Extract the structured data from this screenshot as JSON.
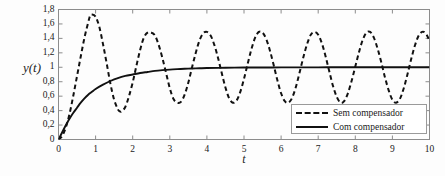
{
  "chart_data": {
    "type": "line",
    "title": "",
    "xlabel": "t",
    "ylabel": "y(t)",
    "xlim": [
      0,
      10
    ],
    "ylim": [
      0,
      1.8
    ],
    "grid": false,
    "legend_position": "lower-right",
    "x_ticks": [
      "0",
      "1",
      "2",
      "3",
      "4",
      "5",
      "6",
      "7",
      "8",
      "9",
      "10"
    ],
    "x_tick_values": [
      0,
      1,
      2,
      3,
      4,
      5,
      6,
      7,
      8,
      9,
      10
    ],
    "y_ticks": [
      "0",
      "0,2",
      "0,4",
      "0,6",
      "0,8",
      "1",
      "1,2",
      "1,4",
      "1,6",
      "1,8"
    ],
    "y_tick_values": [
      0,
      0.2,
      0.4,
      0.6,
      0.8,
      1.0,
      1.2,
      1.4,
      1.6,
      1.8
    ],
    "series": [
      {
        "name": "Sem compensador",
        "style": "dashed",
        "color": "#111111",
        "x": [
          0,
          0.1,
          0.2,
          0.3,
          0.4,
          0.5,
          0.6,
          0.7,
          0.8,
          0.85,
          0.9,
          1.0,
          1.1,
          1.2,
          1.3,
          1.4,
          1.5,
          1.6,
          1.65,
          1.7,
          1.8,
          1.9,
          2.0,
          2.1,
          2.2,
          2.3,
          2.4,
          2.5,
          2.6,
          2.7,
          2.8,
          2.9,
          3.0,
          3.1,
          3.2,
          3.3,
          3.4,
          3.5,
          3.6,
          3.7,
          3.8,
          3.9,
          4.0,
          4.1,
          4.2,
          4.3,
          4.4,
          4.5,
          4.6,
          4.7,
          4.8,
          4.9,
          5.0,
          5.1,
          5.2,
          5.3,
          5.4,
          5.5,
          5.6,
          5.7,
          5.8,
          5.9,
          6.0,
          6.1,
          6.2,
          6.3,
          6.4,
          6.5,
          6.6,
          6.7,
          6.8,
          6.9,
          7.0,
          7.1,
          7.2,
          7.3,
          7.4,
          7.5,
          7.6,
          7.7,
          7.8,
          7.9,
          8.0,
          8.1,
          8.2,
          8.3,
          8.4,
          8.5,
          8.6,
          8.7,
          8.8,
          8.9,
          9.0,
          9.1,
          9.2,
          9.3,
          9.4,
          9.5,
          9.6,
          9.7,
          9.8,
          9.9,
          10.0
        ],
        "y": [
          0.0,
          0.05,
          0.17,
          0.36,
          0.61,
          0.88,
          1.15,
          1.41,
          1.62,
          1.71,
          1.73,
          1.7,
          1.56,
          1.32,
          1.05,
          0.77,
          0.55,
          0.42,
          0.39,
          0.39,
          0.45,
          0.6,
          0.79,
          1.02,
          1.24,
          1.41,
          1.48,
          1.48,
          1.44,
          1.31,
          1.13,
          0.92,
          0.71,
          0.56,
          0.51,
          0.52,
          0.62,
          0.79,
          1.0,
          1.2,
          1.37,
          1.47,
          1.49,
          1.44,
          1.31,
          1.13,
          0.92,
          0.72,
          0.57,
          0.51,
          0.54,
          0.66,
          0.84,
          1.05,
          1.25,
          1.41,
          1.49,
          1.48,
          1.39,
          1.23,
          1.03,
          0.82,
          0.64,
          0.53,
          0.51,
          0.58,
          0.73,
          0.93,
          1.14,
          1.32,
          1.45,
          1.49,
          1.45,
          1.33,
          1.15,
          0.94,
          0.74,
          0.59,
          0.51,
          0.53,
          0.64,
          0.81,
          1.01,
          1.21,
          1.38,
          1.48,
          1.49,
          1.41,
          1.26,
          1.07,
          0.86,
          0.68,
          0.55,
          0.51,
          0.56,
          0.7,
          0.89,
          1.1,
          1.29,
          1.43,
          1.49,
          1.47,
          1.37
        ]
      },
      {
        "name": "Com compensador",
        "style": "solid",
        "color": "#111111",
        "x": [
          0,
          0.1,
          0.2,
          0.3,
          0.4,
          0.5,
          0.6,
          0.7,
          0.8,
          0.9,
          1.0,
          1.2,
          1.4,
          1.6,
          1.8,
          2.0,
          2.2,
          2.4,
          2.6,
          2.8,
          3.0,
          3.2,
          3.4,
          3.6,
          3.8,
          4.0,
          4.5,
          5.0,
          5.5,
          6.0,
          6.5,
          7.0,
          7.5,
          8.0,
          8.5,
          9.0,
          9.5,
          10.0
        ],
        "y": [
          0.0,
          0.1,
          0.2,
          0.29,
          0.37,
          0.44,
          0.51,
          0.57,
          0.62,
          0.66,
          0.7,
          0.76,
          0.81,
          0.85,
          0.88,
          0.9,
          0.92,
          0.935,
          0.95,
          0.96,
          0.968,
          0.974,
          0.979,
          0.983,
          0.986,
          0.989,
          0.993,
          0.996,
          0.997,
          0.998,
          0.999,
          0.999,
          1.0,
          1.0,
          1.0,
          1.0,
          1.0,
          1.0
        ]
      }
    ],
    "annotations": []
  },
  "legend": {
    "entries": [
      {
        "label": "Sem compensador",
        "style": "dashed"
      },
      {
        "label": "Com compensador",
        "style": "solid"
      }
    ]
  },
  "colors": {
    "curve": "#111111",
    "axis": "#8c8c8c",
    "background": "#fdfdfd",
    "legend_border": "#9a9a9a"
  }
}
